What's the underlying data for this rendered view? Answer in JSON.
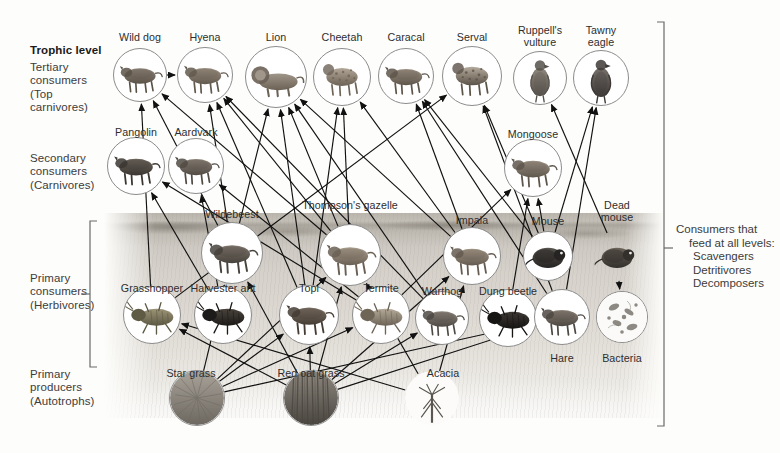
{
  "colors": {
    "ink": "#2e2e2e",
    "label": "#3c3c3c",
    "bracket": "#6a6a6a",
    "medallion_ring": "#8c8c8c",
    "page": "#fdfdfb"
  },
  "levels": {
    "heading": "Trophic level",
    "tertiary": "Tertiary\nconsumers\n(Top\ncarnivores)",
    "tertiary_lines": [
      "Tertiary",
      "consumers",
      "(Top",
      "carnivores)"
    ],
    "secondary_lines": [
      "Secondary",
      "consumers",
      "(Carnivores)"
    ],
    "primary_consumers_lines": [
      "Primary",
      "consumers",
      "(Herbivores)"
    ],
    "primary_producers_lines": [
      "Primary",
      "producers",
      "(Autotrophs)"
    ]
  },
  "right_note": {
    "line1": "Consumers that",
    "line2": "feed at all levels:",
    "line3": "Scavengers",
    "line4": "Detritivores",
    "line5": "Decomposers"
  },
  "chart_data": {
    "type": "diagram",
    "diagram_kind": "food-web",
    "trophic_levels": [
      {
        "name": "Tertiary consumers (Top carnivores)",
        "members": [
          "Wild dog",
          "Hyena",
          "Lion",
          "Cheetah",
          "Caracal",
          "Serval",
          "Ruppell's vulture",
          "Tawny eagle"
        ]
      },
      {
        "name": "Secondary consumers (Carnivores)",
        "members": [
          "Pangolin",
          "Aardvark",
          "Mongoose"
        ]
      },
      {
        "name": "Primary consumers (Herbivores)",
        "members": [
          "Wildebeest",
          "Thompson's gazelle",
          "Impala",
          "Mouse",
          "Grasshopper",
          "Harvester ant",
          "Topi",
          "Termite",
          "Warthog",
          "Dung beetle",
          "Hare"
        ]
      },
      {
        "name": "Primary producers (Autotrophs)",
        "members": [
          "Star grass",
          "Red oat grass",
          "Acacia"
        ]
      },
      {
        "name": "Consumers that feed at all levels: Scavengers, Detritivores, Decomposers",
        "members": [
          "Dead mouse",
          "Bacteria",
          "Ruppell's vulture",
          "Dung beetle",
          "Termite"
        ]
      }
    ]
  },
  "nodes": [
    {
      "id": "wilddog",
      "label": "Wild dog",
      "x": 140,
      "y": 75,
      "r": 26,
      "label_x": 140,
      "label_y": 31,
      "group": "tertiary"
    },
    {
      "id": "hyena",
      "label": "Hyena",
      "x": 205,
      "y": 75,
      "r": 27,
      "label_x": 205,
      "label_y": 31,
      "group": "tertiary"
    },
    {
      "id": "lion",
      "label": "Lion",
      "x": 276,
      "y": 77,
      "r": 30,
      "label_x": 276,
      "label_y": 31,
      "group": "tertiary"
    },
    {
      "id": "cheetah",
      "label": "Cheetah",
      "x": 342,
      "y": 77,
      "r": 28,
      "label_x": 342,
      "label_y": 31,
      "group": "tertiary"
    },
    {
      "id": "caracal",
      "label": "Caracal",
      "x": 406,
      "y": 76,
      "r": 27,
      "label_x": 406,
      "label_y": 31,
      "group": "tertiary"
    },
    {
      "id": "serval",
      "label": "Serval",
      "x": 472,
      "y": 76,
      "r": 29,
      "label_x": 472,
      "label_y": 31,
      "group": "tertiary"
    },
    {
      "id": "vulture",
      "label": "Ruppell's vulture",
      "label_lines": [
        "Ruppell's",
        "vulture"
      ],
      "x": 540,
      "y": 78,
      "r": 26,
      "label_x": 540,
      "label_y": 24,
      "group": "tertiary"
    },
    {
      "id": "eagle",
      "label": "Tawny eagle",
      "label_lines": [
        "Tawny",
        "eagle"
      ],
      "x": 601,
      "y": 78,
      "r": 27,
      "label_x": 601,
      "label_y": 24,
      "group": "tertiary"
    },
    {
      "id": "pangolin",
      "label": "Pangolin",
      "x": 136,
      "y": 166,
      "r": 28,
      "label_x": 136,
      "label_y": 126,
      "group": "secondary"
    },
    {
      "id": "aardvark",
      "label": "Aardvark",
      "x": 196,
      "y": 166,
      "r": 27,
      "label_x": 196,
      "label_y": 126,
      "group": "secondary"
    },
    {
      "id": "mongoose",
      "label": "Mongoose",
      "x": 533,
      "y": 168,
      "r": 28,
      "label_x": 533,
      "label_y": 128,
      "group": "secondary"
    },
    {
      "id": "wildebeest",
      "label": "Wildebeest",
      "x": 232,
      "y": 253,
      "r": 30,
      "label_x": 232,
      "label_y": 208,
      "group": "primary"
    },
    {
      "id": "gazelle",
      "label": "Thompson's gazelle",
      "x": 350,
      "y": 255,
      "r": 30,
      "label_x": 350,
      "label_y": 199,
      "group": "primary"
    },
    {
      "id": "impala",
      "label": "Impala",
      "x": 472,
      "y": 256,
      "r": 28,
      "label_x": 472,
      "label_y": 214,
      "group": "primary"
    },
    {
      "id": "mouse",
      "label": "Mouse",
      "x": 548,
      "y": 256,
      "r": 24,
      "label_x": 548,
      "label_y": 215,
      "group": "primary"
    },
    {
      "id": "deadmouse",
      "label": "Dead mouse",
      "label_lines": [
        "Dead",
        "mouse"
      ],
      "x": 617,
      "y": 256,
      "r": 24,
      "label_x": 617,
      "label_y": 199,
      "group": "detritus"
    },
    {
      "id": "grasshopper",
      "label": "Grasshopper",
      "x": 152,
      "y": 315,
      "r": 28,
      "label_x": 152,
      "label_y": 282,
      "group": "primary"
    },
    {
      "id": "ant",
      "label": "Harvester ant",
      "x": 223,
      "y": 315,
      "r": 28,
      "label_x": 223,
      "label_y": 282,
      "group": "primary"
    },
    {
      "id": "topi",
      "label": "Topi",
      "x": 309,
      "y": 315,
      "r": 29,
      "label_x": 309,
      "label_y": 282,
      "group": "primary"
    },
    {
      "id": "termite",
      "label": "Termite",
      "x": 381,
      "y": 315,
      "r": 28,
      "label_x": 381,
      "label_y": 282,
      "group": "primary"
    },
    {
      "id": "warthog",
      "label": "Warthog",
      "x": 442,
      "y": 318,
      "r": 26,
      "label_x": 442,
      "label_y": 285,
      "group": "primary"
    },
    {
      "id": "dungbeetle",
      "label": "Dung beetle",
      "x": 508,
      "y": 318,
      "r": 28,
      "label_x": 508,
      "label_y": 285,
      "group": "primary"
    },
    {
      "id": "hare",
      "label": "Hare",
      "x": 562,
      "y": 317,
      "r": 27,
      "label_x": 562,
      "label_y": 352,
      "group": "primary"
    },
    {
      "id": "bacteria",
      "label": "Bacteria",
      "x": 622,
      "y": 317,
      "r": 25,
      "label_x": 622,
      "label_y": 352,
      "group": "detritus"
    },
    {
      "id": "stargrass",
      "label": "Star grass",
      "x": 197,
      "y": 398,
      "r": 27,
      "label_x": 191,
      "label_y": 367,
      "group": "producer"
    },
    {
      "id": "redoat",
      "label": "Red oat grass",
      "x": 311,
      "y": 398,
      "r": 27,
      "label_x": 311,
      "label_y": 367,
      "group": "producer"
    },
    {
      "id": "acacia",
      "label": "Acacia",
      "x": 432,
      "y": 398,
      "r": 27,
      "label_x": 443,
      "label_y": 367,
      "group": "producer"
    }
  ],
  "links": [
    {
      "from": "wilddog",
      "to": "hyena"
    },
    {
      "from": "stargrass",
      "to": "wildebeest"
    },
    {
      "from": "stargrass",
      "to": "topi"
    },
    {
      "from": "stargrass",
      "to": "gazelle"
    },
    {
      "from": "stargrass",
      "to": "termite"
    },
    {
      "from": "stargrass",
      "to": "hare"
    },
    {
      "from": "redoat",
      "to": "wildebeest"
    },
    {
      "from": "redoat",
      "to": "gazelle"
    },
    {
      "from": "redoat",
      "to": "impala"
    },
    {
      "from": "redoat",
      "to": "topi"
    },
    {
      "from": "redoat",
      "to": "warthog"
    },
    {
      "from": "redoat",
      "to": "grasshopper"
    },
    {
      "from": "redoat",
      "to": "hare"
    },
    {
      "from": "acacia",
      "to": "gazelle"
    },
    {
      "from": "acacia",
      "to": "impala"
    },
    {
      "from": "acacia",
      "to": "grasshopper"
    },
    {
      "from": "grasshopper",
      "to": "wilddog"
    },
    {
      "from": "grasshopper",
      "to": "serval"
    },
    {
      "from": "ant",
      "to": "pangolin"
    },
    {
      "from": "ant",
      "to": "aardvark"
    },
    {
      "from": "termite",
      "to": "pangolin"
    },
    {
      "from": "termite",
      "to": "aardvark"
    },
    {
      "from": "termite",
      "to": "mongoose"
    },
    {
      "from": "wildebeest",
      "to": "lion"
    },
    {
      "from": "wildebeest",
      "to": "hyena"
    },
    {
      "from": "wildebeest",
      "to": "wilddog"
    },
    {
      "from": "gazelle",
      "to": "lion"
    },
    {
      "from": "gazelle",
      "to": "cheetah"
    },
    {
      "from": "gazelle",
      "to": "hyena"
    },
    {
      "from": "gazelle",
      "to": "wilddog"
    },
    {
      "from": "topi",
      "to": "lion"
    },
    {
      "from": "topi",
      "to": "hyena"
    },
    {
      "from": "topi",
      "to": "cheetah"
    },
    {
      "from": "impala",
      "to": "cheetah"
    },
    {
      "from": "impala",
      "to": "lion"
    },
    {
      "from": "impala",
      "to": "caracal"
    },
    {
      "from": "warthog",
      "to": "lion"
    },
    {
      "from": "warthog",
      "to": "hyena"
    },
    {
      "from": "mouse",
      "to": "caracal"
    },
    {
      "from": "mouse",
      "to": "serval"
    },
    {
      "from": "mouse",
      "to": "mongoose"
    },
    {
      "from": "mouse",
      "to": "eagle"
    },
    {
      "from": "hare",
      "to": "caracal"
    },
    {
      "from": "hare",
      "to": "serval"
    },
    {
      "from": "hare",
      "to": "eagle"
    },
    {
      "from": "dungbeetle",
      "to": "mongoose"
    },
    {
      "from": "dungbeetle",
      "to": "hare"
    },
    {
      "from": "deadmouse",
      "to": "bacteria"
    },
    {
      "from": "deadmouse",
      "to": "vulture"
    }
  ]
}
